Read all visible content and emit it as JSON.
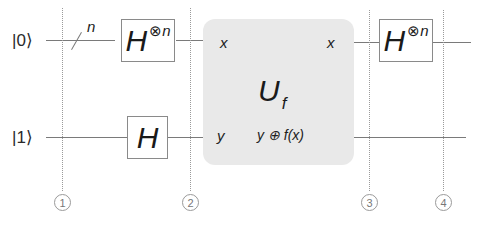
{
  "diagram": {
    "inputs": {
      "top_ket": "|0⟩",
      "bottom_ket": "|1⟩"
    },
    "bus_label": "n",
    "gates": {
      "h_top_left": {
        "base": "H",
        "superscript_op": "⊗",
        "superscript_var": "n"
      },
      "h_bottom": {
        "base": "H"
      },
      "h_top_right": {
        "base": "H",
        "superscript_op": "⊗",
        "superscript_var": "n"
      }
    },
    "oracle": {
      "name": "U",
      "subscript": "f",
      "input_top": "x",
      "input_bottom": "y",
      "output_top": "x",
      "output_bottom": "y ⊕ f(x)"
    },
    "steps": [
      "1",
      "2",
      "3",
      "4"
    ]
  }
}
